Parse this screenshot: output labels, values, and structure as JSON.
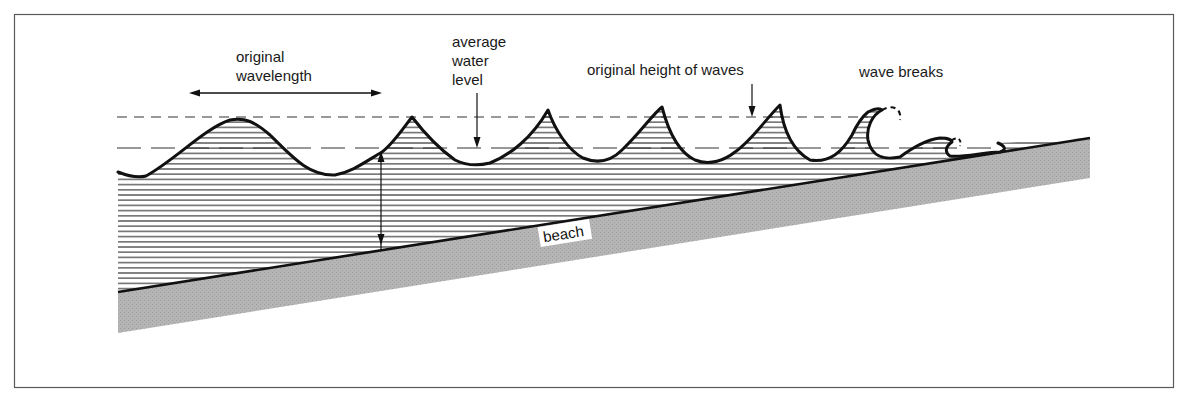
{
  "diagram": {
    "labels": {
      "wavelength_line1": "original",
      "wavelength_line2": "wavelength",
      "water_level_line1": "average",
      "water_level_line2": "water",
      "water_level_line3": "level",
      "wave_height": "original height of waves",
      "wave_breaks": "wave breaks",
      "beach": "beach"
    },
    "colors": {
      "frame": "#555555",
      "ink": "#111111",
      "water_hatch": "#333333",
      "beach_fill": "#b3b3b3",
      "background": "#ffffff"
    },
    "elements": {
      "frame": "border-frame",
      "upper_dashed_line": "original-wave-height-line",
      "lower_dashed_line": "average-water-level-line",
      "wave_profile": "wave-profile-curve",
      "water_body": "hatched-water-region",
      "beach_slope": "shaded-beach-wedge",
      "depth_arrow": "depth-double-arrow",
      "wavelength_arrow": "wavelength-double-arrow"
    }
  }
}
